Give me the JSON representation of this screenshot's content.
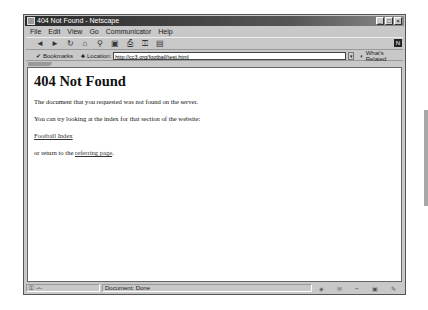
{
  "window": {
    "title": "404 Not Found - Netscape",
    "buttons": [
      "minimize",
      "maximize",
      "close"
    ]
  },
  "menubar": {
    "items": [
      "File",
      "Edit",
      "View",
      "Go",
      "Communicator",
      "Help"
    ]
  },
  "toolbar": {
    "icons": [
      {
        "name": "back-icon",
        "glyph": "◄"
      },
      {
        "name": "forward-icon",
        "glyph": "►"
      },
      {
        "name": "reload-icon",
        "glyph": "↻"
      },
      {
        "name": "home-icon",
        "glyph": "⌂"
      },
      {
        "name": "search-icon",
        "glyph": "⚲"
      },
      {
        "name": "netscape-guide-icon",
        "glyph": "▣"
      },
      {
        "name": "print-icon",
        "glyph": "⎙"
      },
      {
        "name": "security-icon",
        "glyph": "🔒"
      },
      {
        "name": "stop-icon",
        "glyph": "▤"
      }
    ],
    "logo": "N"
  },
  "location_bar": {
    "bookmarks_label": "Bookmarks",
    "location_label": "Location:",
    "url": "http://cc3.org/football/test.html",
    "whats_related_label": "What's Related"
  },
  "page": {
    "heading": "404 Not Found",
    "p1": "The document that you requested was not found on the server.",
    "p2": "You can try looking at the index for that section of the website:",
    "link_index": "Football Index",
    "p3_prefix": "or return to the ",
    "link_referring": "referring page",
    "p3_suffix": "."
  },
  "statusbar": {
    "message": "Document: Done"
  }
}
